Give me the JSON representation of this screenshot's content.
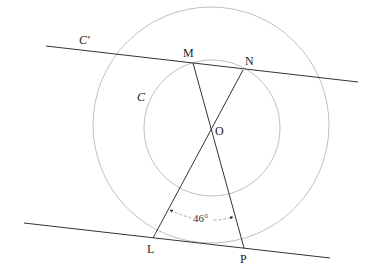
{
  "diagram": {
    "colors": {
      "line": "#333333",
      "circle": "#aaaaaa",
      "text": "#222222",
      "background": "#ffffff"
    },
    "labels": {
      "line_top": "C′",
      "circle_inner": "C",
      "point_M": "M",
      "point_N": "N",
      "point_O": "O",
      "point_L": "L",
      "point_P": "P",
      "angle": "46°"
    },
    "angle_value_deg": 46
  }
}
